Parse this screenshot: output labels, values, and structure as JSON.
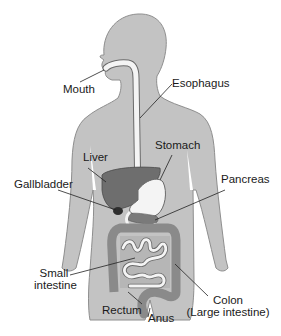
{
  "diagram": {
    "type": "anatomy",
    "labels": {
      "mouth": "Mouth",
      "esophagus": "Esophagus",
      "stomach": "Stomach",
      "liver": "Liver",
      "gallbladder": "Gallbladder",
      "pancreas": "Pancreas",
      "small_intestine_1": "Small",
      "small_intestine_2": "intestine",
      "colon_1": "Colon",
      "colon_2": "(Large intestine)",
      "rectum": "Rectum",
      "anus": "Anus"
    },
    "colors": {
      "body": "#c3c3c3",
      "body_outline": "#8e8e8e",
      "liver": "#6e6e6e",
      "gallbladder": "#2e2e2e",
      "intestine": "#8a8a8a",
      "tube": "#f4f4f4",
      "leader": "#222222"
    }
  }
}
